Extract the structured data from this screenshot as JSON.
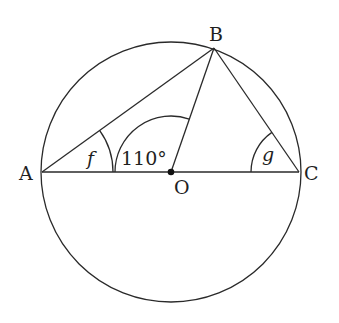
{
  "diagram": {
    "type": "circle-geometry",
    "circle": {
      "center_label": "O",
      "cx": 171,
      "cy": 172,
      "r": 130
    },
    "points": {
      "A": {
        "label": "A",
        "x": 42,
        "y": 172
      },
      "B": {
        "label": "B",
        "x": 214,
        "y": 48
      },
      "C": {
        "label": "C",
        "x": 299,
        "y": 172
      },
      "O": {
        "label": "O",
        "x": 171,
        "y": 172
      }
    },
    "segments": [
      "AB",
      "BC",
      "AC",
      "OB"
    ],
    "angles": {
      "f": {
        "label": "f",
        "vertex": "A",
        "between": [
          "AB",
          "AC"
        ]
      },
      "AOB": {
        "label": "110°",
        "vertex": "O",
        "between": [
          "OA",
          "OB"
        ]
      },
      "g": {
        "label": "g",
        "vertex": "C",
        "between": [
          "CB",
          "CA"
        ]
      }
    },
    "colors": {
      "stroke": "#2a2a2a",
      "text": "#1f1f1f",
      "background": "#ffffff"
    }
  }
}
